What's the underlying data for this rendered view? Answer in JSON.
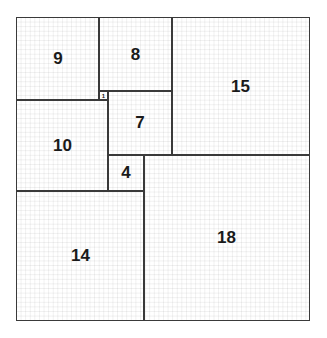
{
  "diagram": {
    "type": "squared rectangle",
    "width_units": 32,
    "height_units": 33,
    "squares": [
      {
        "label": "9",
        "size": 9,
        "x": 0,
        "y": 0
      },
      {
        "label": "8",
        "size": 8,
        "x": 9,
        "y": 0
      },
      {
        "label": "15",
        "size": 15,
        "x": 17,
        "y": 0
      },
      {
        "label": "1",
        "size": 1,
        "x": 9,
        "y": 8
      },
      {
        "label": "7",
        "size": 7,
        "x": 10,
        "y": 8
      },
      {
        "label": "10",
        "size": 10,
        "x": 0,
        "y": 9
      },
      {
        "label": "4",
        "size": 4,
        "x": 10,
        "y": 15
      },
      {
        "label": "18",
        "size": 18,
        "x": 14,
        "y": 15
      },
      {
        "label": "14",
        "size": 14,
        "x": 0,
        "y": 19
      }
    ],
    "colors": {
      "line": "#3a3a3a",
      "grid": "#e8e8e8",
      "text": "#1a1a1a"
    }
  }
}
